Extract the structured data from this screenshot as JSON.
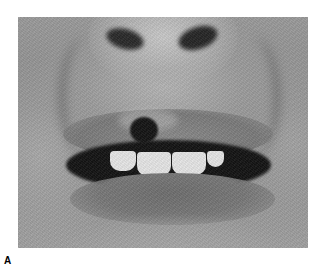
{
  "figure": {
    "panel_label": "A",
    "image": {
      "description": "Grayscale clinical close-up photograph of the lower face showing nose, partially open mouth with upper teeth visible, and a dark crusted lesion on the upper lip",
      "color_mode": "grayscale",
      "background": "#ffffff"
    }
  }
}
